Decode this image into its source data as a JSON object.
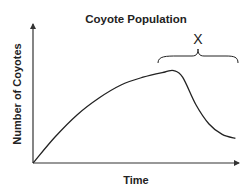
{
  "chart_data": {
    "type": "line",
    "title": "Coyote Population",
    "xlabel": "Time",
    "ylabel": "Number of Coyotes",
    "x_ticks": [],
    "y_ticks": [],
    "grid": false,
    "legend": null,
    "series": [
      {
        "name": "Coyote Population",
        "points": [
          {
            "x": 0,
            "y": 0
          },
          {
            "x": 10,
            "y": 20
          },
          {
            "x": 20,
            "y": 37
          },
          {
            "x": 30,
            "y": 50
          },
          {
            "x": 40,
            "y": 60
          },
          {
            "x": 50,
            "y": 66
          },
          {
            "x": 60,
            "y": 70
          },
          {
            "x": 64,
            "y": 71
          },
          {
            "x": 68,
            "y": 66
          },
          {
            "x": 74,
            "y": 45
          },
          {
            "x": 80,
            "y": 30
          },
          {
            "x": 86,
            "y": 22
          },
          {
            "x": 92,
            "y": 19
          }
        ]
      }
    ],
    "annotations": [
      {
        "type": "brace",
        "label": "X",
        "x_start": 62,
        "x_end": 100,
        "description": "Brace spanning the period of population decline after the peak"
      }
    ],
    "axis_ranges": {
      "x": [
        0,
        100
      ],
      "y": [
        0,
        100
      ]
    }
  },
  "colors": {
    "line": "#222222",
    "text": "#222222",
    "background": "#ffffff"
  }
}
